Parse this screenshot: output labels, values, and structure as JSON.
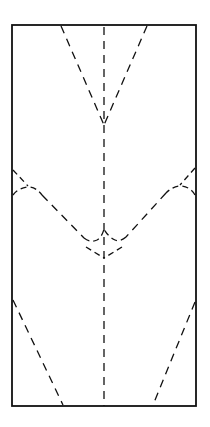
{
  "diagram": {
    "type": "crease-pattern",
    "colors": {
      "line": "#111111",
      "background": "#ffffff"
    },
    "paper": {
      "x": 12,
      "y": 25,
      "width": 184,
      "height": 381
    },
    "center_crease": {
      "x": 104,
      "y1": 25,
      "y2": 406
    },
    "top_v": {
      "left_start": [
        60,
        25
      ],
      "right_start": [
        147,
        25
      ],
      "apex": [
        104,
        125
      ]
    },
    "middle_v": {
      "left_start": [
        12,
        195
      ],
      "right_start": [
        196,
        195
      ],
      "apex": [
        104,
        258
      ]
    },
    "bottom_creases": {
      "left": [
        [
          12,
          300
        ],
        [
          63,
          406
        ]
      ],
      "right": [
        [
          196,
          302
        ],
        [
          153,
          406
        ]
      ]
    }
  }
}
